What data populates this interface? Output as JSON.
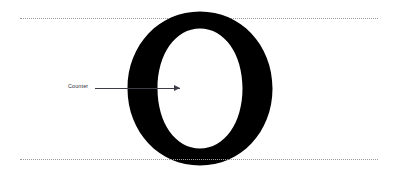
{
  "diagram": {
    "title": "Counter",
    "glyph": {
      "character": "O",
      "style": "serif-capital-o",
      "fill_color": "#000000",
      "counter_color": "#ffffff"
    },
    "guidelines": [
      {
        "name": "cap-height",
        "color": "#9a9a9a",
        "style": "dotted"
      },
      {
        "name": "baseline",
        "color": "#9a9a9a",
        "style": "dotted"
      }
    ],
    "annotation": {
      "label": "Counter",
      "line_color": "#3d3d4a",
      "arrow_direction": "right"
    },
    "background_color": "#ffffff"
  }
}
